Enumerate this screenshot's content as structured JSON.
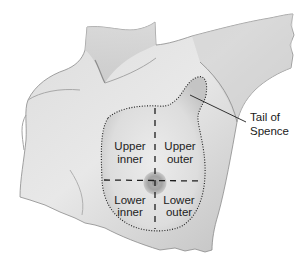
{
  "diagram": {
    "quadrants": [
      {
        "line1": "Upper",
        "line2": "inner"
      },
      {
        "line1": "Upper",
        "line2": "outer"
      },
      {
        "line1": "Lower",
        "line2": "inner"
      },
      {
        "line1": "Lower",
        "line2": "outer"
      }
    ],
    "callout": {
      "line1": "Tail of",
      "line2": "Spence"
    },
    "colors": {
      "background": "#ffffff",
      "skin_light": "#e6e6e6",
      "skin_mid": "#c8c8c8",
      "skin_dark": "#9a9a9a",
      "lines": "#1e1e1e",
      "text": "#222222"
    }
  }
}
